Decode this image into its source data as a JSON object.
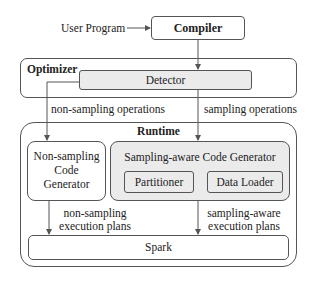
{
  "diagram": {
    "input_label": "User Program",
    "compiler": {
      "label": "Compiler"
    },
    "optimizer": {
      "title": "Optimizer",
      "detector": {
        "label": "Detector"
      }
    },
    "edges": {
      "non_sampling_ops": "non-sampling operations",
      "sampling_ops": "sampling operations",
      "non_sampling_plans_line1": "non-sampling",
      "non_sampling_plans_line2": "execution plans",
      "sampling_plans_line1": "sampling-aware",
      "sampling_plans_line2": "execution plans"
    },
    "runtime": {
      "title": "Runtime",
      "non_sampling_generator": {
        "line1": "Non-sampling",
        "line2": "Code",
        "line3": "Generator"
      },
      "sampling_generator": {
        "label": "Sampling-aware Code Generator",
        "partitioner": "Partitioner",
        "data_loader": "Data Loader"
      },
      "spark": {
        "label": "Spark"
      }
    }
  }
}
